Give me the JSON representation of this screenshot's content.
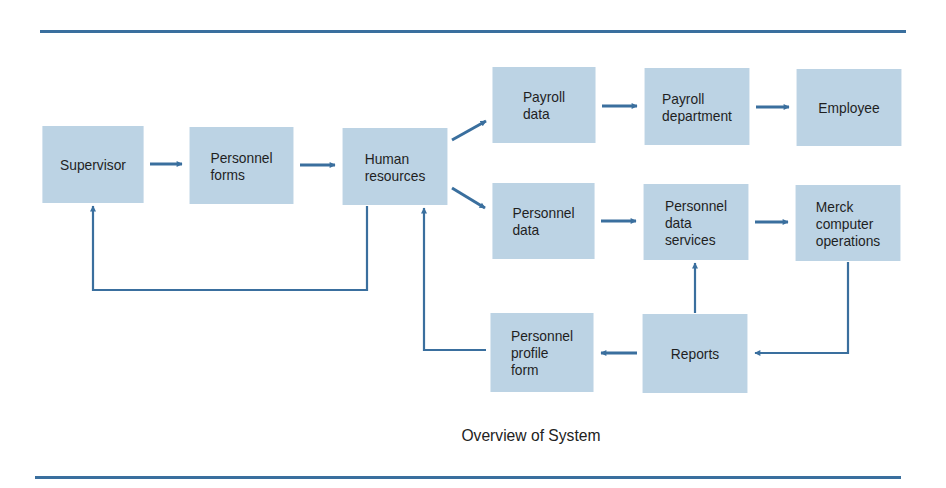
{
  "diagram": {
    "caption": "Overview of System",
    "colors": {
      "box_fill": "#bcd3e4",
      "line": "#3a6f9e",
      "text": "#1f1f1f"
    },
    "nodes": [
      {
        "id": "supervisor",
        "label": "Supervisor"
      },
      {
        "id": "personnel_forms",
        "label": "Personnel\nforms"
      },
      {
        "id": "human_resources",
        "label": "Human\nresources"
      },
      {
        "id": "payroll_data",
        "label": "Payroll\ndata"
      },
      {
        "id": "payroll_department",
        "label": "Payroll\ndepartment"
      },
      {
        "id": "employee",
        "label": "Employee"
      },
      {
        "id": "personnel_data",
        "label": "Personnel\ndata"
      },
      {
        "id": "personnel_data_services",
        "label": "Personnel\ndata\nservices"
      },
      {
        "id": "merck_computer_operations",
        "label": "Merck\ncomputer\noperations"
      },
      {
        "id": "personnel_profile_form",
        "label": "Personnel\nprofile\nform"
      },
      {
        "id": "reports",
        "label": "Reports"
      }
    ],
    "edges": [
      {
        "from": "supervisor",
        "to": "personnel_forms"
      },
      {
        "from": "personnel_forms",
        "to": "human_resources"
      },
      {
        "from": "human_resources",
        "to": "payroll_data"
      },
      {
        "from": "human_resources",
        "to": "personnel_data"
      },
      {
        "from": "human_resources",
        "to": "supervisor"
      },
      {
        "from": "payroll_data",
        "to": "payroll_department"
      },
      {
        "from": "payroll_department",
        "to": "employee"
      },
      {
        "from": "personnel_data",
        "to": "personnel_data_services"
      },
      {
        "from": "personnel_data_services",
        "to": "merck_computer_operations"
      },
      {
        "from": "merck_computer_operations",
        "to": "reports"
      },
      {
        "from": "reports",
        "to": "personnel_data_services"
      },
      {
        "from": "reports",
        "to": "personnel_profile_form"
      },
      {
        "from": "personnel_profile_form",
        "to": "human_resources"
      }
    ]
  }
}
